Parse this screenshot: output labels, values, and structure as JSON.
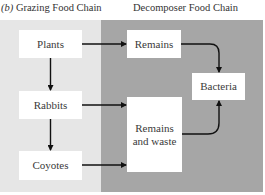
{
  "titles": {
    "left_prefix": "(b)",
    "left": "Grazing Food Chain",
    "right": "Decomposer Food Chain"
  },
  "colors": {
    "grazing_panel": "#e6e6e6",
    "decomposer_panel": "#a6a6a6",
    "box": "#ffffff",
    "arrow": "#111111"
  },
  "nodes": {
    "plants": "Plants",
    "rabbits": "Rabbits",
    "coyotes": "Coyotes",
    "remains": "Remains",
    "remains_waste_line1": "Remains",
    "remains_waste_line2": "and waste",
    "bacteria": "Bacteria"
  },
  "edges": [
    {
      "from": "Plants",
      "to": "Rabbits"
    },
    {
      "from": "Rabbits",
      "to": "Coyotes"
    },
    {
      "from": "Plants",
      "to": "Remains"
    },
    {
      "from": "Rabbits",
      "to": "Remains and waste"
    },
    {
      "from": "Coyotes",
      "to": "Remains and waste"
    },
    {
      "from": "Remains",
      "to": "Bacteria"
    },
    {
      "from": "Remains and waste",
      "to": "Bacteria"
    }
  ]
}
